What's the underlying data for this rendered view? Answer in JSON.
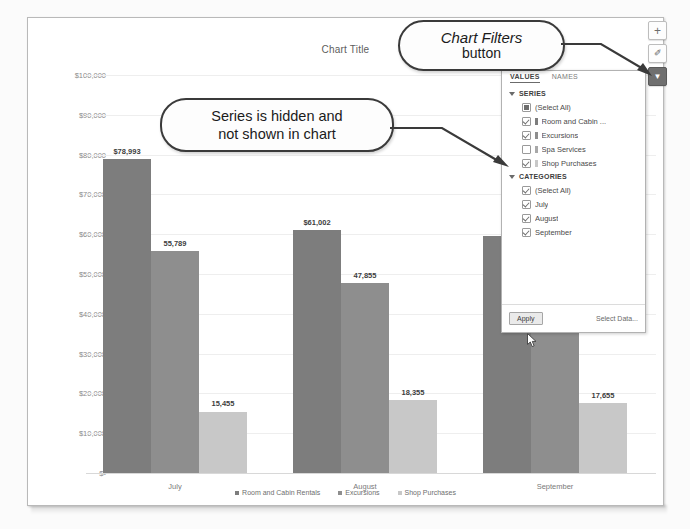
{
  "chart_data": {
    "type": "bar",
    "title": "Chart Title",
    "categories": [
      "July",
      "August",
      "September"
    ],
    "series": [
      {
        "name": "Room and Cabin Rentals",
        "color": "#7d7d7d",
        "values": [
          78993,
          61002,
          59500
        ],
        "labels": [
          "$78,993",
          "$61,002",
          ""
        ]
      },
      {
        "name": "Excursions",
        "color": "#8e8e8e",
        "values": [
          55789,
          47855,
          56800
        ],
        "labels": [
          "55,789",
          "47,855",
          ""
        ]
      },
      {
        "name": "Shop Purchases",
        "color": "#c8c8c8",
        "values": [
          15455,
          18355,
          17655
        ],
        "labels": [
          "15,455",
          "18,355",
          "17,655"
        ]
      }
    ],
    "hidden_series": [
      "Spa Services"
    ],
    "ylabel": "",
    "xlabel": "",
    "ylim": [
      0,
      100000
    ],
    "ytick_labels": [
      "$100,000",
      "$90,000",
      "$80,000",
      "$70,000",
      "$60,000",
      "$50,000",
      "$40,000",
      "$30,000",
      "$20,000",
      "$10,000",
      "$-"
    ],
    "ytick_values": [
      100000,
      90000,
      80000,
      70000,
      60000,
      50000,
      40000,
      30000,
      20000,
      10000,
      0
    ],
    "grid": true,
    "legend_position": "bottom",
    "legend": [
      "Room and Cabin Rentals",
      "Excursions",
      "Shop Purchases"
    ]
  },
  "side_buttons": [
    {
      "name": "chart-elements-button",
      "icon": "plus-icon",
      "glyph": "+",
      "active": false
    },
    {
      "name": "chart-styles-button",
      "icon": "brush-icon",
      "glyph": "✐",
      "active": false
    },
    {
      "name": "chart-filters-button",
      "icon": "funnel-icon",
      "glyph": "▼",
      "active": true
    }
  ],
  "filter_panel": {
    "tabs": [
      {
        "label": "VALUES",
        "active": true
      },
      {
        "label": "NAMES",
        "active": false
      }
    ],
    "sections": [
      {
        "heading": "SERIES",
        "items": [
          {
            "label": "(Select All)",
            "state": "partial",
            "swatch": false
          },
          {
            "label": "Room and Cabin ...",
            "state": "checked",
            "swatch": true,
            "swatch_color": "#7d7d7d"
          },
          {
            "label": "Excursions",
            "state": "checked",
            "swatch": true,
            "swatch_color": "#8e8e8e"
          },
          {
            "label": "Spa Services",
            "state": "unchecked",
            "swatch": true,
            "swatch_color": "#a8a8a8"
          },
          {
            "label": "Shop Purchases",
            "state": "checked",
            "swatch": true,
            "swatch_color": "#c8c8c8"
          }
        ]
      },
      {
        "heading": "CATEGORIES",
        "items": [
          {
            "label": "(Select All)",
            "state": "checked",
            "swatch": false
          },
          {
            "label": "July",
            "state": "checked",
            "swatch": false
          },
          {
            "label": "August",
            "state": "checked",
            "swatch": false
          },
          {
            "label": "September",
            "state": "checked",
            "swatch": false
          }
        ]
      }
    ],
    "apply_label": "Apply",
    "select_data_label": "Select Data..."
  },
  "callouts": {
    "chart_filters": {
      "line1": "Chart Filters",
      "line2": "button"
    },
    "series_hidden": {
      "line1": "Series is hidden and",
      "line2": "not shown in chart"
    }
  }
}
